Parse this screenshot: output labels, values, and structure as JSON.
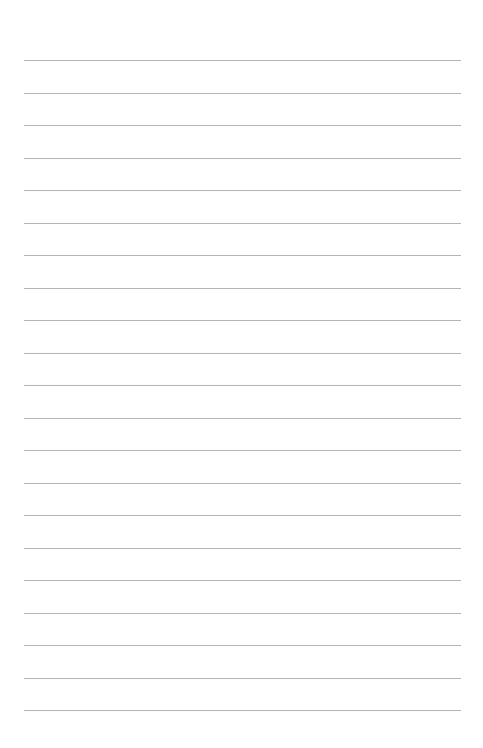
{
  "page": {
    "type": "lined-paper",
    "background_color": "#ffffff",
    "line_color": "#b4b4b4",
    "line_count": 21,
    "first_line_y": 60,
    "line_spacing": 32.5,
    "line_left": 24,
    "line_width": 437
  }
}
